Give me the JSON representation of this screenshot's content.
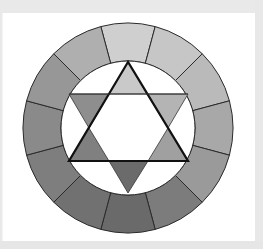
{
  "figure": {
    "title": "",
    "center": [
      128,
      128
    ],
    "outer_radius": 105,
    "inner_radius": 67,
    "segment_stroke": "#2a2a2a",
    "frame_color": "#e9e9e9",
    "background": "#ffffff"
  },
  "wheel_segments": [
    {
      "position": "top",
      "angle": 0,
      "fill": "#cfcfcf"
    },
    {
      "position": "top-right-1",
      "angle": 30,
      "fill": "#c6c6c6"
    },
    {
      "position": "top-right-2",
      "angle": 60,
      "fill": "#bababa"
    },
    {
      "position": "right",
      "angle": 90,
      "fill": "#a8a8a8"
    },
    {
      "position": "bottom-right-1",
      "angle": 120,
      "fill": "#9a9a9a"
    },
    {
      "position": "bottom-right-2",
      "angle": 150,
      "fill": "#7c7c7c"
    },
    {
      "position": "bottom",
      "angle": 180,
      "fill": "#6a6a6a"
    },
    {
      "position": "bottom-left-1",
      "angle": 210,
      "fill": "#717171"
    },
    {
      "position": "bottom-left-2",
      "angle": 240,
      "fill": "#7e7e7e"
    },
    {
      "position": "left",
      "angle": 270,
      "fill": "#8a8a8a"
    },
    {
      "position": "top-left-2",
      "angle": 300,
      "fill": "#979797"
    },
    {
      "position": "top-left-1",
      "angle": 330,
      "fill": "#afafaf"
    }
  ],
  "hexagram": {
    "main_triangle": {
      "points": [
        [
          128,
          62
        ],
        [
          69,
          161
        ],
        [
          188,
          161
        ]
      ],
      "stroke": "#111111",
      "stroke_width": 2.2
    },
    "horizontal_line_y": 94,
    "small_triangles": [
      {
        "name": "top",
        "points": [
          [
            128,
            62
          ],
          [
            109,
            94
          ],
          [
            147,
            94
          ]
        ],
        "fill": "#c9c9c9"
      },
      {
        "name": "upper-right",
        "points": [
          [
            147,
            94
          ],
          [
            188,
            94
          ],
          [
            168,
            128
          ]
        ],
        "fill": "#b4b4b4"
      },
      {
        "name": "lower-right",
        "points": [
          [
            168,
            128
          ],
          [
            188,
            161
          ],
          [
            148,
            161
          ]
        ],
        "fill": "#a0a0a0"
      },
      {
        "name": "bottom",
        "points": [
          [
            148,
            161
          ],
          [
            109,
            161
          ],
          [
            128,
            193
          ]
        ],
        "fill": "#6b6b6b"
      },
      {
        "name": "lower-left",
        "points": [
          [
            109,
            161
          ],
          [
            69,
            161
          ],
          [
            89,
            128
          ]
        ],
        "fill": "#808080"
      },
      {
        "name": "upper-left",
        "points": [
          [
            89,
            128
          ],
          [
            69,
            94
          ],
          [
            109,
            94
          ]
        ],
        "fill": "#8e8e8e"
      }
    ],
    "inner_hexagon_fill": "#ffffff",
    "thin_stroke": "#333333"
  }
}
